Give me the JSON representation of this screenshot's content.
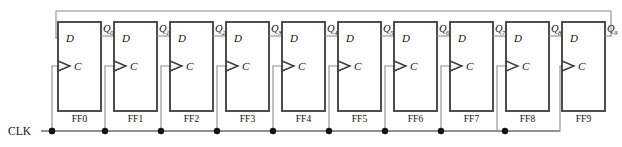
{
  "diagram": {
    "clock_label": "CLK",
    "colors": {
      "background": "#ffffff",
      "box_stroke": "#3a3a3a",
      "wire": "#8c8c8c",
      "clock_bus": "#6e6e6e",
      "junction_dot": "#111111",
      "text": "#111111"
    },
    "stages": [
      {
        "name": "FF0",
        "d_label": "D",
        "c_label": "C",
        "q_label": "Q",
        "q_subscript": "0"
      },
      {
        "name": "FF1",
        "d_label": "D",
        "c_label": "C",
        "q_label": "Q",
        "q_subscript": "1"
      },
      {
        "name": "FF2",
        "d_label": "D",
        "c_label": "C",
        "q_label": "Q",
        "q_subscript": "2"
      },
      {
        "name": "FF3",
        "d_label": "D",
        "c_label": "C",
        "q_label": "Q",
        "q_subscript": "3"
      },
      {
        "name": "FF4",
        "d_label": "D",
        "c_label": "C",
        "q_label": "Q",
        "q_subscript": "4"
      },
      {
        "name": "FF5",
        "d_label": "D",
        "c_label": "C",
        "q_label": "Q",
        "q_subscript": "5"
      },
      {
        "name": "FF6",
        "d_label": "D",
        "c_label": "C",
        "q_label": "Q",
        "q_subscript": "6"
      },
      {
        "name": "FF7",
        "d_label": "D",
        "c_label": "C",
        "q_label": "Q",
        "q_subscript": "7"
      },
      {
        "name": "FF8",
        "d_label": "D",
        "c_label": "C",
        "q_label": "Q",
        "q_subscript": "8"
      },
      {
        "name": "FF9",
        "d_label": "D",
        "c_label": "C",
        "q_label": "Q",
        "q_subscript": "9"
      }
    ],
    "feedback": {
      "from": "Q9",
      "to": "FF0.D"
    }
  }
}
